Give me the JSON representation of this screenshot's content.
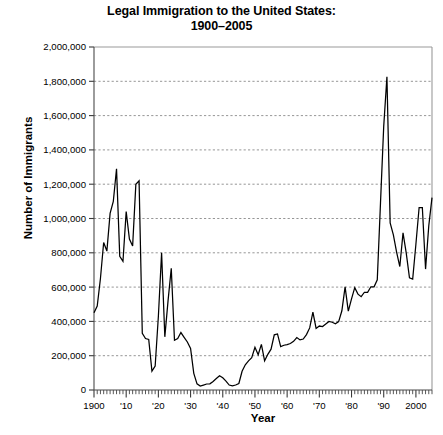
{
  "chart_data": {
    "type": "line",
    "title": "Legal Immigration to the United States: 1900–2005",
    "title_line1": "Legal Immigration to the United States:",
    "title_line2": "1900–2005",
    "xlabel": "Year",
    "ylabel": "Number of Immigrants",
    "xlim": [
      1900,
      2005
    ],
    "ylim": [
      0,
      2000000
    ],
    "grid": true,
    "legend": "none",
    "y_tick_labels": [
      "0",
      "200,000",
      "400,000",
      "600,000",
      "800,000",
      "1,000,000",
      "1,200,000",
      "1,400,000",
      "1,600,000",
      "1,800,000",
      "2,000,000"
    ],
    "y_tick_values": [
      0,
      200000,
      400000,
      600000,
      800000,
      1000000,
      1200000,
      1400000,
      1600000,
      1800000,
      2000000
    ],
    "x_tick_labels": [
      "1900",
      "'10",
      "'20",
      "'30",
      "'40",
      "'50",
      "'60",
      "'70",
      "'80",
      "'90",
      "2000"
    ],
    "x_tick_values": [
      1900,
      1910,
      1920,
      1930,
      1940,
      1950,
      1960,
      1970,
      1980,
      1990,
      2000
    ],
    "x_minor_tick_step": 1,
    "line_color": "#000000",
    "grid_color": "#8a8a8a",
    "axis_color": "#4a4a4a",
    "x": [
      1900,
      1901,
      1902,
      1903,
      1904,
      1905,
      1906,
      1907,
      1908,
      1909,
      1910,
      1911,
      1912,
      1913,
      1914,
      1915,
      1916,
      1917,
      1918,
      1919,
      1920,
      1921,
      1922,
      1923,
      1924,
      1925,
      1926,
      1927,
      1928,
      1929,
      1930,
      1931,
      1932,
      1933,
      1934,
      1935,
      1936,
      1937,
      1938,
      1939,
      1940,
      1941,
      1942,
      1943,
      1944,
      1945,
      1946,
      1947,
      1948,
      1949,
      1950,
      1951,
      1952,
      1953,
      1954,
      1955,
      1956,
      1957,
      1958,
      1959,
      1960,
      1961,
      1962,
      1963,
      1964,
      1965,
      1966,
      1967,
      1968,
      1969,
      1970,
      1971,
      1972,
      1973,
      1974,
      1975,
      1976,
      1977,
      1978,
      1979,
      1980,
      1981,
      1982,
      1983,
      1984,
      1985,
      1986,
      1987,
      1988,
      1989,
      1990,
      1991,
      1992,
      1993,
      1994,
      1995,
      1996,
      1997,
      1998,
      1999,
      2000,
      2001,
      2002,
      2003,
      2004,
      2005
    ],
    "values": [
      450000,
      490000,
      650000,
      860000,
      810000,
      1030000,
      1100000,
      1290000,
      780000,
      750000,
      1040000,
      880000,
      840000,
      1200000,
      1220000,
      330000,
      300000,
      295000,
      110000,
      140000,
      430000,
      800000,
      310000,
      520000,
      710000,
      290000,
      300000,
      335000,
      307000,
      280000,
      242000,
      97000,
      36000,
      23000,
      29000,
      35000,
      36000,
      50000,
      67000,
      83000,
      71000,
      52000,
      29000,
      24000,
      29000,
      38000,
      109000,
      147000,
      170000,
      188000,
      249000,
      206000,
      266000,
      170000,
      208000,
      238000,
      322000,
      327000,
      253000,
      261000,
      265000,
      271000,
      284000,
      306000,
      292000,
      297000,
      323000,
      362000,
      454000,
      359000,
      373000,
      370000,
      385000,
      400000,
      395000,
      386000,
      399000,
      462000,
      601000,
      460000,
      531000,
      597000,
      559000,
      544000,
      570000,
      570000,
      602000,
      602000,
      643000,
      1091000,
      1536000,
      1827000,
      974000,
      904000,
      804000,
      720000,
      916000,
      798000,
      654000,
      647000,
      850000,
      1064000,
      1064000,
      705000,
      958000,
      1122000
    ]
  }
}
